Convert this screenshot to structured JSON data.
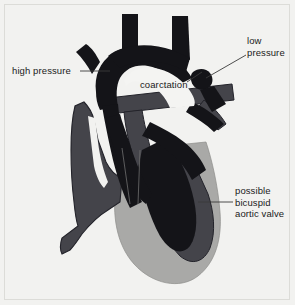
{
  "figure": {
    "background_color": "#f2f2f0",
    "border_color": "#dcdcd8"
  },
  "palette": {
    "dark_vessel": "#141418",
    "mid_vessel": "#44444a",
    "light_chamber": "#a9a9a7",
    "outline": "#6e6e6e",
    "leader_line": "#3a3a3a",
    "text": "#1a1a1a",
    "inner_arch": "#f4f4f2"
  },
  "annotations": {
    "high_pressure": {
      "text": "high pressure",
      "lines": [
        "high pressure"
      ]
    },
    "low_pressure": {
      "text": "low pressure",
      "lines": [
        "low",
        "pressure"
      ]
    },
    "coarctation": {
      "text": "coarctation",
      "lines": [
        "coarctation"
      ]
    },
    "bicuspid_valve": {
      "text": "possible bicuspid aortic valve",
      "lines": [
        "possible",
        "bicuspid",
        "aortic valve"
      ]
    }
  },
  "anatomy": {
    "parts": [
      {
        "name": "aortic-arch",
        "shade": "dark"
      },
      {
        "name": "brachiocephalic-trunk",
        "shade": "dark"
      },
      {
        "name": "left-common-carotid-artery",
        "shade": "dark"
      },
      {
        "name": "left-subclavian-artery",
        "shade": "dark"
      },
      {
        "name": "coarctation-narrowing",
        "shade": "dark"
      },
      {
        "name": "descending-aorta",
        "shade": "dark"
      },
      {
        "name": "left-ventricle",
        "shade": "dark"
      },
      {
        "name": "interventricular-septum",
        "shade": "dark"
      },
      {
        "name": "pulmonary-artery",
        "shade": "mid"
      },
      {
        "name": "superior-vena-cava",
        "shade": "mid"
      },
      {
        "name": "right-atrium",
        "shade": "mid"
      },
      {
        "name": "right-ventricle",
        "shade": "mid"
      },
      {
        "name": "inferior-vena-cava",
        "shade": "mid"
      },
      {
        "name": "ventricular-outline",
        "shade": "light"
      }
    ]
  }
}
